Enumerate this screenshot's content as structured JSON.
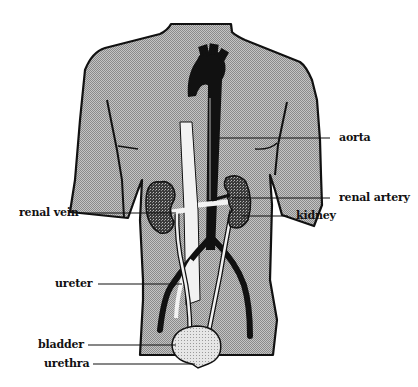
{
  "diagram": {
    "colors": {
      "body_fill": "#a9a9a9",
      "outline": "#111111",
      "vessel_dark": "#111111",
      "vessel_light": "#f2f2f2",
      "bladder_fill": "#d9d9d9",
      "background": "#ffffff"
    },
    "labels": {
      "aorta": "aorta",
      "renal_artery": "renal artery",
      "kidney": "kidney",
      "renal_vein": "renal vein",
      "ureter": "ureter",
      "bladder": "bladder",
      "urethra": "urethra"
    }
  }
}
